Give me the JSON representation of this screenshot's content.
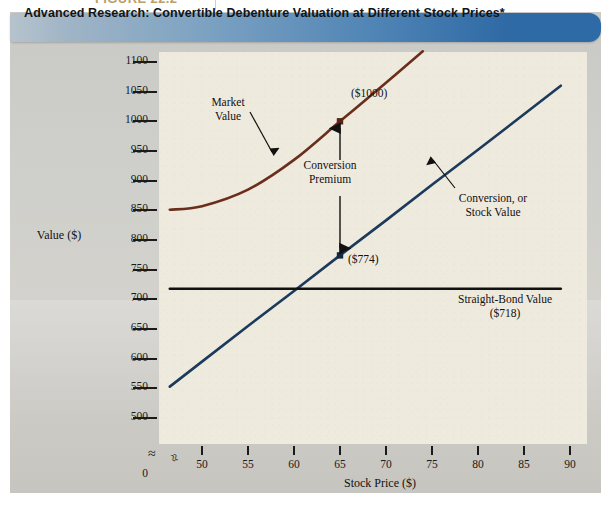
{
  "figure": {
    "label": "FIGURE 22.2"
  },
  "banner": {
    "title": "Advanced Research: Convertible Debenture Valuation at Different Stock Prices*"
  },
  "axes": {
    "ylabel": "Value ($)",
    "xlabel": "Stock Price ($)",
    "y_ticks": [
      "1100",
      "1050",
      "1000",
      "950",
      "900",
      "850",
      "800",
      "750",
      "700",
      "650",
      "600",
      "550",
      "500"
    ],
    "y_zero": "0",
    "x_ticks": [
      "50",
      "55",
      "60",
      "65",
      "70",
      "75",
      "80",
      "85",
      "90"
    ],
    "break_symbol_y": "≈",
    "break_symbol_x": "≈"
  },
  "annotations": {
    "market_value": "Market\nValue",
    "conversion_premium": "Conversion\nPremium",
    "conversion_stock_value": "Conversion, or\nStock Value",
    "straight_bond_value": "Straight-Bond Value\n($718)",
    "point_upper": "($1000)",
    "point_lower": "($774)"
  },
  "colors": {
    "market_value_line": "#6b2d1c",
    "conversion_line": "#1b3a5c",
    "straight_bond_line": "#111111",
    "plot_background": "#eeeade",
    "panel_background": "#cfcfcb",
    "banner_start": "#b6c3cd",
    "banner_end": "#2d6aa6"
  },
  "chart_data": {
    "type": "line",
    "title": "Advanced Research: Convertible Debenture Valuation at Different Stock Prices*",
    "xlabel": "Stock Price ($)",
    "ylabel": "Value ($)",
    "xlim": [
      45,
      90
    ],
    "ylim": [
      500,
      1100
    ],
    "xticks": [
      50,
      55,
      60,
      65,
      70,
      75,
      80,
      85,
      90
    ],
    "yticks": [
      500,
      550,
      600,
      650,
      700,
      750,
      800,
      850,
      900,
      950,
      1000,
      1050,
      1100
    ],
    "grid": false,
    "legend": "none (inline labels)",
    "axis_break": true,
    "series": [
      {
        "name": "Market Value",
        "color": "#6b2d1c",
        "x": [
          46.5,
          50,
          55,
          60,
          65,
          70,
          74
        ],
        "values": [
          851,
          857,
          885,
          935,
          1000,
          1065,
          1118
        ]
      },
      {
        "name": "Conversion, or Stock Value",
        "color": "#1b3a5c",
        "x": [
          46.5,
          50,
          55,
          60,
          65,
          70,
          75,
          80,
          85,
          89
        ],
        "values": [
          553,
          595,
          655,
          714,
          774,
          833,
          893,
          952,
          1012,
          1060
        ]
      },
      {
        "name": "Straight-Bond Value",
        "color": "#111111",
        "x": [
          46.5,
          89
        ],
        "values": [
          718,
          718
        ]
      }
    ],
    "points": [
      {
        "label": "($1000)",
        "x": 65,
        "y": 1000,
        "series": "Market Value"
      },
      {
        "label": "($774)",
        "x": 65,
        "y": 774,
        "series": "Conversion, or Stock Value"
      }
    ],
    "annotations": [
      {
        "text": "Market Value",
        "x": 55.5,
        "y": 967
      },
      {
        "text": "Conversion Premium",
        "x": 65,
        "y": 890,
        "note": "double-headed arrow from 774 to 1000 at x=65"
      },
      {
        "text": "Conversion, or Stock Value",
        "x": 79,
        "y": 925
      },
      {
        "text": "Straight-Bond Value ($718)",
        "x": 81,
        "y": 676
      }
    ]
  }
}
